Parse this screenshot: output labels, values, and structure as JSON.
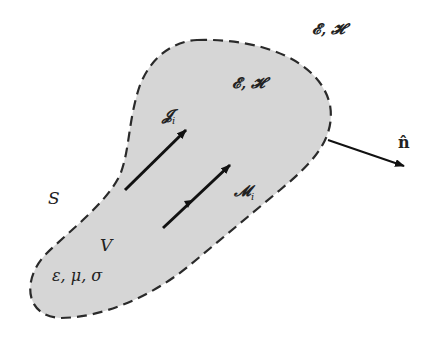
{
  "figure": {
    "region": {
      "fill": "#d6d6d6",
      "outline": "#2a2a2a",
      "outline_style": "dashed"
    },
    "labels": {
      "outside_fields": "𝓔, 𝓗",
      "inside_fields": "𝓔, 𝓗",
      "electric_source": "𝓙",
      "electric_source_sub": "i",
      "magnetic_source": "𝓜",
      "magnetic_source_sub": "i",
      "surface": "S",
      "volume": "V",
      "material_params": "ε, μ, σ",
      "normal": "n̂"
    }
  }
}
